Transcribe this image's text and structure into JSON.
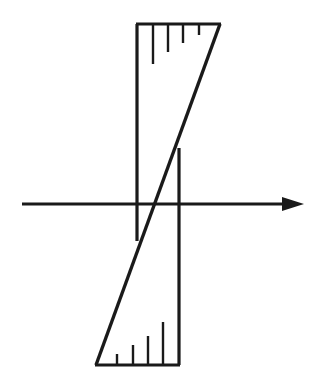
{
  "figure": {
    "title": "Hand-drawn hysteresis / sign-function sketch",
    "background_color": "#ffffff",
    "ink_color": "#1a1a1a",
    "canvas": {
      "width": 316,
      "height": 387
    }
  },
  "axis": {
    "name": "horizontal-axis",
    "label": "",
    "y": 204,
    "x_start": 22,
    "x_end": 304,
    "stroke_width": 3.2,
    "arrowhead": {
      "name": "axis-arrowhead",
      "tip_x": 304,
      "tip_y": 204,
      "back_x": 282,
      "half_height": 7
    }
  },
  "verticals": [
    {
      "name": "left-vertical-line",
      "x": 137,
      "y_top": 24,
      "y_bottom": 241,
      "stroke_width": 3.2
    },
    {
      "name": "right-vertical-line",
      "x": 179,
      "y_top": 148,
      "y_bottom": 365,
      "stroke_width": 3.2
    }
  ],
  "diagonal": {
    "name": "diagonal-transition-line",
    "x1": 96,
    "y1": 365,
    "x2": 220,
    "y2": 24,
    "stroke_width": 3.4
  },
  "edges": [
    {
      "name": "top-edge-line",
      "x1": 136,
      "y1": 24,
      "x2": 221,
      "y2": 24,
      "stroke_width": 3.2
    },
    {
      "name": "bottom-edge-line",
      "x1": 95,
      "y1": 365,
      "x2": 180,
      "y2": 365,
      "stroke_width": 3.2
    }
  ],
  "hatch_marks": {
    "top": {
      "name": "top-hatch-group",
      "description": "ticks descending from the top edge, decreasing in length toward the right",
      "y_start": 24,
      "ticks": [
        {
          "x": 153,
          "length": 40
        },
        {
          "x": 168,
          "length": 28
        },
        {
          "x": 183,
          "length": 19
        },
        {
          "x": 199,
          "length": 11
        }
      ],
      "stroke_width": 2.4
    },
    "bottom": {
      "name": "bottom-hatch-group",
      "description": "ticks ascending from the bottom edge, increasing in length toward the right",
      "y_start": 365,
      "ticks": [
        {
          "x": 117,
          "length": 11
        },
        {
          "x": 133,
          "length": 20
        },
        {
          "x": 148,
          "length": 29
        },
        {
          "x": 163,
          "length": 43
        }
      ],
      "stroke_width": 2.4
    }
  }
}
